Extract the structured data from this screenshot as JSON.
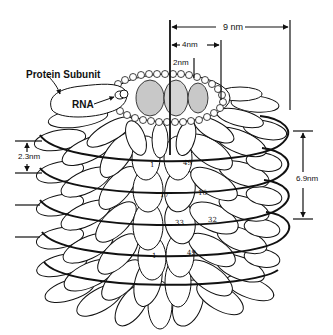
{
  "diagram": {
    "labels": {
      "protein_subunit": "Protein Subunit",
      "rna": "RNA"
    },
    "dimensions": {
      "outer_diameter": "9 nm",
      "mid_radius": "4nm",
      "inner_radius": "2nm",
      "subunit_height": "2.3nm",
      "helix_pitch": "6.9nm"
    },
    "subunit_numbers": [
      {
        "id": "upper-1",
        "text": "1"
      },
      {
        "id": "upper-49",
        "text": "49"
      },
      {
        "id": "17",
        "text": "17"
      },
      {
        "id": "16",
        "text": "16"
      },
      {
        "id": "33",
        "text": "33"
      },
      {
        "id": "32",
        "text": "32"
      },
      {
        "id": "lower-1",
        "text": "1"
      },
      {
        "id": "lower-49",
        "text": "49"
      }
    ],
    "colors": {
      "ink": "#111111",
      "background": "#ffffff",
      "stipple": "#c8c8c8"
    }
  }
}
